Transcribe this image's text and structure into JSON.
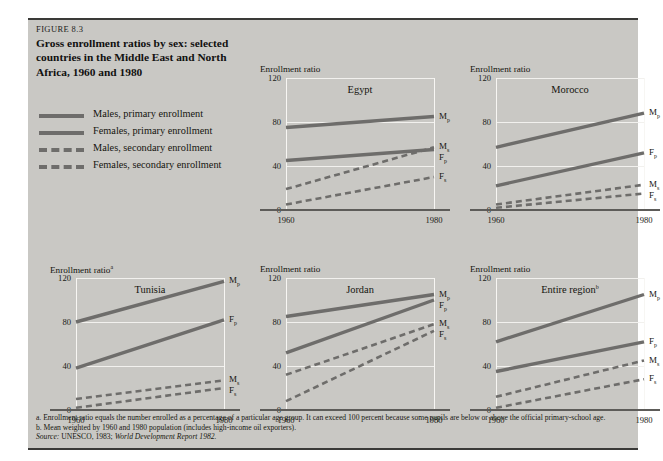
{
  "figure": {
    "label": "FIGURE 8.3",
    "title": "Gross enrollment ratios by sex: selected countries in the Middle East and North Africa, 1960 and 1980"
  },
  "legend": {
    "items": [
      {
        "label": "Males, primary enrollment",
        "style": "solid",
        "key": "Mp"
      },
      {
        "label": "Females, primary enrollment",
        "style": "solid",
        "key": "Fp"
      },
      {
        "label": "Males, secondary enrollment",
        "style": "dashed",
        "key": "Ms"
      },
      {
        "label": "Females, secondary enrollment",
        "style": "dashed",
        "key": "Fs"
      }
    ]
  },
  "notes": {
    "a": "a.  Enrollment ratio equals the number enrolled as a percentage of a particular age group. It can exceed 100 percent because some pupils are below or above the official primary-school age.",
    "b": "b.  Mean weighted by 1960 and 1980 population (includes high-income oil exporters).",
    "source_label": "Source:",
    "source_text": "UNESCO, 1983;",
    "source_italic": "World Development Report 1982."
  },
  "colors": {
    "panel_background": "#c9c8c4",
    "series_line": "#6e6d6b",
    "gridline": "#f2f1ee",
    "axis": "#5d5c59",
    "text": "#15150f"
  },
  "chart_data": [
    {
      "type": "line",
      "title": "Egypt",
      "title_superscript": "",
      "ylabel": "Enrollment ratio",
      "ylabel_superscript": "",
      "xlabel": "",
      "x": [
        1960,
        1980
      ],
      "xticks": [
        "1960",
        "1980"
      ],
      "yticks": [
        0,
        40,
        80,
        120
      ],
      "ylim": [
        0,
        120
      ],
      "grid": true,
      "legend_position": "right-endpoint-labels",
      "series": [
        {
          "name": "Males, primary enrollment",
          "key": "Mp",
          "style": "solid",
          "values": [
            75,
            85
          ],
          "end_label": "M",
          "end_label_sub": "p"
        },
        {
          "name": "Females, primary enrollment",
          "key": "Fp",
          "style": "solid",
          "values": [
            45,
            55
          ],
          "end_label": "F",
          "end_label_sub": "p"
        },
        {
          "name": "Males, secondary enrollment",
          "key": "Ms",
          "style": "dashed",
          "values": [
            19,
            57
          ],
          "end_label": "M",
          "end_label_sub": "s"
        },
        {
          "name": "Females, secondary enrollment",
          "key": "Fs",
          "style": "dashed",
          "values": [
            5,
            30
          ],
          "end_label": "F",
          "end_label_sub": "s"
        }
      ]
    },
    {
      "type": "line",
      "title": "Morocco",
      "title_superscript": "",
      "ylabel": "Enrollment ratio",
      "ylabel_superscript": "",
      "xlabel": "",
      "x": [
        1960,
        1980
      ],
      "xticks": [
        "1960",
        "1980"
      ],
      "yticks": [
        0,
        40,
        80,
        120
      ],
      "ylim": [
        0,
        120
      ],
      "grid": true,
      "legend_position": "right-endpoint-labels",
      "series": [
        {
          "name": "Males, primary enrollment",
          "key": "Mp",
          "style": "solid",
          "values": [
            57,
            88
          ],
          "end_label": "M",
          "end_label_sub": "p"
        },
        {
          "name": "Females, primary enrollment",
          "key": "Fp",
          "style": "solid",
          "values": [
            22,
            52
          ],
          "end_label": "F",
          "end_label_sub": "p"
        },
        {
          "name": "Males, secondary enrollment",
          "key": "Ms",
          "style": "dashed",
          "values": [
            5,
            23
          ],
          "end_label": "M",
          "end_label_sub": "s"
        },
        {
          "name": "Females, secondary enrollment",
          "key": "Fs",
          "style": "dashed",
          "values": [
            2,
            15
          ],
          "end_label": "F",
          "end_label_sub": "s"
        }
      ]
    },
    {
      "type": "line",
      "title": "Tunisia",
      "title_superscript": "",
      "ylabel": "Enrollment ratio",
      "ylabel_superscript": "a",
      "xlabel": "",
      "x": [
        1960,
        1980
      ],
      "xticks": [
        "1960",
        "1980"
      ],
      "yticks": [
        0,
        40,
        80,
        120
      ],
      "ylim": [
        0,
        120
      ],
      "grid": true,
      "legend_position": "right-endpoint-labels",
      "series": [
        {
          "name": "Males, primary enrollment",
          "key": "Mp",
          "style": "solid",
          "values": [
            80,
            117
          ],
          "end_label": "M",
          "end_label_sub": "p"
        },
        {
          "name": "Females, primary enrollment",
          "key": "Fp",
          "style": "solid",
          "values": [
            38,
            82
          ],
          "end_label": "F",
          "end_label_sub": "p"
        },
        {
          "name": "Males, secondary enrollment",
          "key": "Ms",
          "style": "dashed",
          "values": [
            10,
            27
          ],
          "end_label": "M",
          "end_label_sub": "s"
        },
        {
          "name": "Females, secondary enrollment",
          "key": "Fs",
          "style": "dashed",
          "values": [
            2,
            20
          ],
          "end_label": "F",
          "end_label_sub": "s"
        }
      ]
    },
    {
      "type": "line",
      "title": "Jordan",
      "title_superscript": "",
      "ylabel": "Enrollment ratio",
      "ylabel_superscript": "",
      "xlabel": "",
      "x": [
        1960,
        1980
      ],
      "xticks": [
        "1960",
        "1980"
      ],
      "yticks": [
        0,
        40,
        80,
        120
      ],
      "ylim": [
        0,
        120
      ],
      "grid": true,
      "legend_position": "right-endpoint-labels",
      "series": [
        {
          "name": "Males, primary enrollment",
          "key": "Mp",
          "style": "solid",
          "values": [
            85,
            105
          ],
          "end_label": "M",
          "end_label_sub": "p"
        },
        {
          "name": "Females, primary enrollment",
          "key": "Fp",
          "style": "solid",
          "values": [
            52,
            100
          ],
          "end_label": "F",
          "end_label_sub": "p"
        },
        {
          "name": "Males, secondary enrollment",
          "key": "Ms",
          "style": "dashed",
          "values": [
            32,
            78
          ],
          "end_label": "M",
          "end_label_sub": "s"
        },
        {
          "name": "Females, secondary enrollment",
          "key": "Fs",
          "style": "dashed",
          "values": [
            8,
            72
          ],
          "end_label": "F",
          "end_label_sub": "s"
        }
      ]
    },
    {
      "type": "line",
      "title": "Entire region",
      "title_superscript": "b",
      "ylabel": "Enrollment ratio",
      "ylabel_superscript": "",
      "xlabel": "",
      "x": [
        1960,
        1980
      ],
      "xticks": [
        "1960",
        "1980"
      ],
      "yticks": [
        0,
        40,
        80,
        120
      ],
      "ylim": [
        0,
        120
      ],
      "grid": true,
      "legend_position": "right-endpoint-labels",
      "series": [
        {
          "name": "Males, primary enrollment",
          "key": "Mp",
          "style": "solid",
          "values": [
            62,
            105
          ],
          "end_label": "M",
          "end_label_sub": "p"
        },
        {
          "name": "Females, primary enrollment",
          "key": "Fp",
          "style": "solid",
          "values": [
            35,
            62
          ],
          "end_label": "F",
          "end_label_sub": "p"
        },
        {
          "name": "Males, secondary enrollment",
          "key": "Ms",
          "style": "dashed",
          "values": [
            12,
            45
          ],
          "end_label": "M",
          "end_label_sub": "s"
        },
        {
          "name": "Females, secondary enrollment",
          "key": "Fs",
          "style": "dashed",
          "values": [
            2,
            28
          ],
          "end_label": "F",
          "end_label_sub": "s"
        }
      ]
    }
  ]
}
